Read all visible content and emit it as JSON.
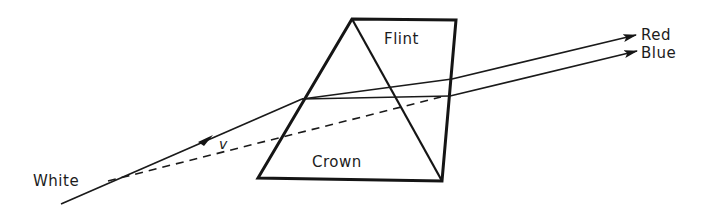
{
  "diagram": {
    "type": "achromatic-prism-dispersion",
    "labels": {
      "incident": "White",
      "velocity": "v",
      "upper_glass": "Flint",
      "lower_glass": "Crown",
      "ray_top": "Red",
      "ray_bottom": "Blue"
    },
    "colors": {
      "ink": "#151515",
      "background": "#ffffff"
    }
  }
}
